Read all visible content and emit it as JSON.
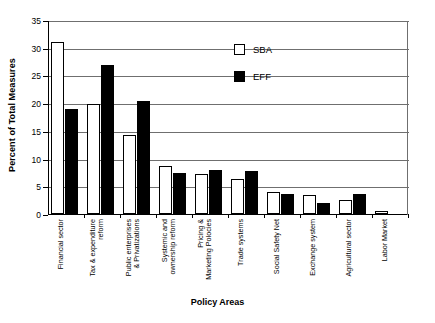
{
  "chart_data": {
    "type": "bar",
    "title": "",
    "xlabel": "Policy Areas",
    "ylabel": "Percent of Total Measures",
    "ylim": [
      0,
      35
    ],
    "yticks": [
      0,
      5,
      10,
      15,
      20,
      25,
      30,
      35
    ],
    "grid": true,
    "legend_position": "upper-right-inside",
    "categories": [
      "Financial sector",
      "Tax & expenditure reform",
      "Public enterprises & Privatizations",
      "Systemic and ownership reform",
      "Pricing & Marketing Policies",
      "Trade systems",
      "Social Safety Net",
      "Exchange system",
      "Agricultural sector",
      "Labor Market"
    ],
    "category_lines": [
      [
        "Financial sector",
        ""
      ],
      [
        "Tax & expenditure",
        "reform"
      ],
      [
        "Public enterprises",
        "& Privatizations"
      ],
      [
        "Systemic and",
        "ownership reform"
      ],
      [
        "Pricing &",
        "Marketing Polocies"
      ],
      [
        "Trade systems",
        ""
      ],
      [
        "Social Safety Net",
        ""
      ],
      [
        "Exchange system",
        ""
      ],
      [
        "Agricultural sector",
        ""
      ],
      [
        "Labor Market",
        ""
      ]
    ],
    "series": [
      {
        "name": "SBA",
        "color": "#ffffff",
        "values": [
          31.0,
          19.9,
          14.3,
          8.7,
          7.3,
          6.3,
          4.0,
          3.5,
          2.6,
          0.5
        ]
      },
      {
        "name": "EFF",
        "color": "#000000",
        "values": [
          18.9,
          26.9,
          20.3,
          7.4,
          8.0,
          7.8,
          3.6,
          2.0,
          3.7,
          0.0
        ]
      }
    ]
  },
  "legend": {
    "items": [
      {
        "label": "SBA",
        "style": "open"
      },
      {
        "label": "EFF",
        "style": "solid"
      }
    ]
  }
}
